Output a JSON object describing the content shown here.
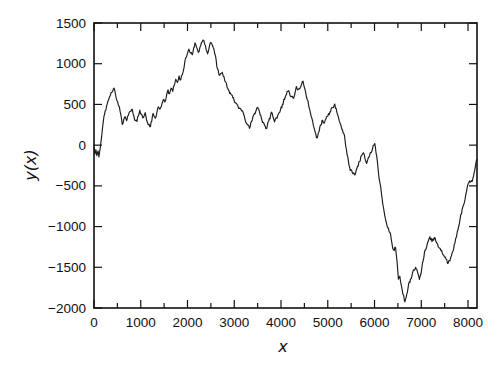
{
  "figure": {
    "background": "#ffffff",
    "line_color": "#1b1b1b",
    "axis_color": "#111111",
    "text_color": "#111111"
  },
  "chart_data": {
    "type": "line",
    "title": "",
    "xlabel": "x",
    "ylabel": "y(x)",
    "xlim": [
      0,
      8192
    ],
    "ylim": [
      -2000,
      1500
    ],
    "grid": false,
    "legend": null,
    "x_major_ticks": [
      0,
      1000,
      2000,
      3000,
      4000,
      5000,
      6000,
      7000,
      8000
    ],
    "x_tick_labels": [
      "0",
      "1000",
      "2000",
      "3000",
      "4000",
      "5000",
      "6000",
      "7000",
      "8000"
    ],
    "x_minor_ticks": [
      500,
      1500,
      2500,
      3500,
      4500,
      5500,
      6500,
      7500
    ],
    "y_major_ticks": [
      -2000,
      -1500,
      -1000,
      -500,
      0,
      500,
      1000,
      1500
    ],
    "y_tick_labels": [
      "−2000",
      "−1500",
      "−1000",
      "−500",
      "0",
      "500",
      "1000",
      "1500"
    ],
    "jitter": {
      "seed": 11,
      "step": 16,
      "amplitude": 26
    },
    "series": [
      {
        "name": "random walk y(x)",
        "points": [
          [
            0,
            -20
          ],
          [
            20,
            -110
          ],
          [
            40,
            -55
          ],
          [
            60,
            -130
          ],
          [
            85,
            -70
          ],
          [
            105,
            -145
          ],
          [
            135,
            -30
          ],
          [
            165,
            110
          ],
          [
            200,
            300
          ],
          [
            240,
            420
          ],
          [
            285,
            510
          ],
          [
            330,
            590
          ],
          [
            385,
            650
          ],
          [
            430,
            700
          ],
          [
            465,
            610
          ],
          [
            505,
            535
          ],
          [
            545,
            460
          ],
          [
            575,
            370
          ],
          [
            605,
            255
          ],
          [
            635,
            315
          ],
          [
            665,
            350
          ],
          [
            695,
            300
          ],
          [
            735,
            365
          ],
          [
            775,
            415
          ],
          [
            820,
            440
          ],
          [
            850,
            365
          ],
          [
            885,
            300
          ],
          [
            920,
            290
          ],
          [
            950,
            360
          ],
          [
            980,
            430
          ],
          [
            1010,
            380
          ],
          [
            1045,
            335
          ],
          [
            1075,
            365
          ],
          [
            1095,
            400
          ],
          [
            1125,
            305
          ],
          [
            1160,
            250
          ],
          [
            1195,
            225
          ],
          [
            1235,
            290
          ],
          [
            1265,
            390
          ],
          [
            1300,
            340
          ],
          [
            1340,
            380
          ],
          [
            1375,
            470
          ],
          [
            1410,
            440
          ],
          [
            1450,
            500
          ],
          [
            1485,
            560
          ],
          [
            1515,
            530
          ],
          [
            1550,
            610
          ],
          [
            1585,
            680
          ],
          [
            1615,
            630
          ],
          [
            1650,
            700
          ],
          [
            1685,
            660
          ],
          [
            1715,
            730
          ],
          [
            1750,
            810
          ],
          [
            1785,
            770
          ],
          [
            1820,
            850
          ],
          [
            1855,
            800
          ],
          [
            1890,
            870
          ],
          [
            1925,
            950
          ],
          [
            1960,
            1070
          ],
          [
            1995,
            1120
          ],
          [
            2030,
            1180
          ],
          [
            2065,
            1130
          ],
          [
            2100,
            1110
          ],
          [
            2130,
            1190
          ],
          [
            2160,
            1255
          ],
          [
            2195,
            1200
          ],
          [
            2230,
            1140
          ],
          [
            2265,
            1200
          ],
          [
            2300,
            1260
          ],
          [
            2330,
            1290
          ],
          [
            2365,
            1240
          ],
          [
            2400,
            1170
          ],
          [
            2430,
            1120
          ],
          [
            2465,
            1200
          ],
          [
            2500,
            1260
          ],
          [
            2530,
            1230
          ],
          [
            2565,
            1180
          ],
          [
            2600,
            1090
          ],
          [
            2640,
            940
          ],
          [
            2675,
            860
          ],
          [
            2710,
            880
          ],
          [
            2745,
            895
          ],
          [
            2780,
            840
          ],
          [
            2815,
            780
          ],
          [
            2850,
            705
          ],
          [
            2890,
            665
          ],
          [
            2930,
            625
          ],
          [
            2970,
            580
          ],
          [
            3010,
            525
          ],
          [
            3060,
            500
          ],
          [
            3110,
            455
          ],
          [
            3160,
            420
          ],
          [
            3215,
            355
          ],
          [
            3270,
            260
          ],
          [
            3325,
            205
          ],
          [
            3370,
            290
          ],
          [
            3430,
            390
          ],
          [
            3470,
            430
          ],
          [
            3500,
            465
          ],
          [
            3540,
            410
          ],
          [
            3580,
            330
          ],
          [
            3620,
            280
          ],
          [
            3660,
            235
          ],
          [
            3695,
            205
          ],
          [
            3735,
            290
          ],
          [
            3795,
            405
          ],
          [
            3830,
            340
          ],
          [
            3860,
            285
          ],
          [
            3900,
            335
          ],
          [
            3950,
            390
          ],
          [
            3990,
            435
          ],
          [
            4030,
            500
          ],
          [
            4075,
            560
          ],
          [
            4115,
            620
          ],
          [
            4145,
            660
          ],
          [
            4185,
            630
          ],
          [
            4230,
            600
          ],
          [
            4270,
            575
          ],
          [
            4300,
            640
          ],
          [
            4330,
            720
          ],
          [
            4370,
            690
          ],
          [
            4410,
            705
          ],
          [
            4440,
            750
          ],
          [
            4470,
            785
          ],
          [
            4510,
            690
          ],
          [
            4560,
            560
          ],
          [
            4610,
            445
          ],
          [
            4660,
            330
          ],
          [
            4710,
            205
          ],
          [
            4760,
            90
          ],
          [
            4800,
            155
          ],
          [
            4850,
            250
          ],
          [
            4890,
            305
          ],
          [
            4925,
            270
          ],
          [
            4960,
            320
          ],
          [
            5000,
            355
          ],
          [
            5045,
            410
          ],
          [
            5090,
            460
          ],
          [
            5150,
            505
          ],
          [
            5195,
            400
          ],
          [
            5245,
            300
          ],
          [
            5300,
            200
          ],
          [
            5360,
            110
          ],
          [
            5400,
            -60
          ],
          [
            5440,
            -185
          ],
          [
            5480,
            -310
          ],
          [
            5530,
            -345
          ],
          [
            5575,
            -365
          ],
          [
            5620,
            -290
          ],
          [
            5680,
            -200
          ],
          [
            5720,
            -135
          ],
          [
            5755,
            -95
          ],
          [
            5795,
            -160
          ],
          [
            5830,
            -225
          ],
          [
            5870,
            -150
          ],
          [
            5910,
            -90
          ],
          [
            5960,
            -40
          ],
          [
            6005,
            20
          ],
          [
            6045,
            -130
          ],
          [
            6080,
            -320
          ],
          [
            6115,
            -460
          ],
          [
            6150,
            -600
          ],
          [
            6190,
            -760
          ],
          [
            6225,
            -880
          ],
          [
            6260,
            -970
          ],
          [
            6300,
            -1025
          ],
          [
            6330,
            -1070
          ],
          [
            6360,
            -1160
          ],
          [
            6390,
            -1270
          ],
          [
            6420,
            -1295
          ],
          [
            6450,
            -1260
          ],
          [
            6480,
            -1420
          ],
          [
            6510,
            -1645
          ],
          [
            6540,
            -1610
          ],
          [
            6575,
            -1725
          ],
          [
            6610,
            -1835
          ],
          [
            6650,
            -1925
          ],
          [
            6690,
            -1830
          ],
          [
            6730,
            -1705
          ],
          [
            6770,
            -1645
          ],
          [
            6805,
            -1590
          ],
          [
            6840,
            -1530
          ],
          [
            6880,
            -1500
          ],
          [
            6920,
            -1560
          ],
          [
            6960,
            -1650
          ],
          [
            7000,
            -1560
          ],
          [
            7040,
            -1420
          ],
          [
            7080,
            -1290
          ],
          [
            7130,
            -1210
          ],
          [
            7185,
            -1125
          ],
          [
            7230,
            -1185
          ],
          [
            7280,
            -1135
          ],
          [
            7330,
            -1200
          ],
          [
            7365,
            -1250
          ],
          [
            7420,
            -1295
          ],
          [
            7480,
            -1350
          ],
          [
            7530,
            -1400
          ],
          [
            7575,
            -1450
          ],
          [
            7630,
            -1380
          ],
          [
            7680,
            -1300
          ],
          [
            7720,
            -1205
          ],
          [
            7770,
            -1060
          ],
          [
            7830,
            -905
          ],
          [
            7890,
            -755
          ],
          [
            7935,
            -670
          ],
          [
            7970,
            -565
          ],
          [
            8005,
            -470
          ],
          [
            8045,
            -455
          ],
          [
            8090,
            -445
          ],
          [
            8130,
            -340
          ],
          [
            8160,
            -250
          ],
          [
            8192,
            -175
          ]
        ]
      }
    ]
  }
}
